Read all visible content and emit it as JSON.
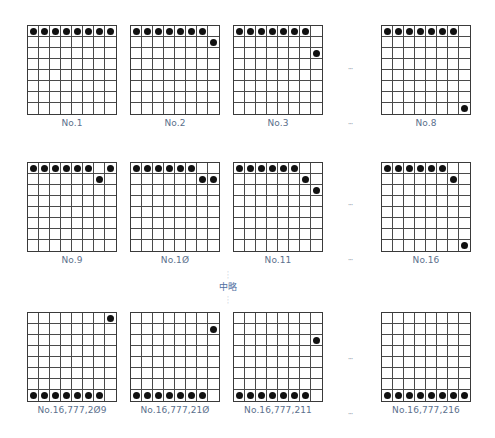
{
  "grid": {
    "rows": 8,
    "cols": 8
  },
  "boards": [
    {
      "label": "No.1",
      "x": 27,
      "y": 25,
      "stones": [
        [
          0,
          0
        ],
        [
          0,
          1
        ],
        [
          0,
          2
        ],
        [
          0,
          3
        ],
        [
          0,
          4
        ],
        [
          0,
          5
        ],
        [
          0,
          6
        ],
        [
          0,
          7
        ]
      ]
    },
    {
      "label": "No.2",
      "x": 130,
      "y": 25,
      "stones": [
        [
          0,
          0
        ],
        [
          0,
          1
        ],
        [
          0,
          2
        ],
        [
          0,
          3
        ],
        [
          0,
          4
        ],
        [
          0,
          5
        ],
        [
          0,
          6
        ],
        [
          1,
          7
        ]
      ]
    },
    {
      "label": "No.3",
      "x": 233,
      "y": 25,
      "stones": [
        [
          0,
          0
        ],
        [
          0,
          1
        ],
        [
          0,
          2
        ],
        [
          0,
          3
        ],
        [
          0,
          4
        ],
        [
          0,
          5
        ],
        [
          0,
          6
        ],
        [
          2,
          7
        ]
      ]
    },
    {
      "label": "No.8",
      "x": 381,
      "y": 25,
      "stones": [
        [
          0,
          0
        ],
        [
          0,
          1
        ],
        [
          0,
          2
        ],
        [
          0,
          3
        ],
        [
          0,
          4
        ],
        [
          0,
          5
        ],
        [
          0,
          6
        ],
        [
          7,
          7
        ]
      ]
    },
    {
      "label": "No.9",
      "x": 27,
      "y": 162,
      "stones": [
        [
          0,
          0
        ],
        [
          0,
          1
        ],
        [
          0,
          2
        ],
        [
          0,
          3
        ],
        [
          0,
          4
        ],
        [
          0,
          5
        ],
        [
          1,
          6
        ],
        [
          0,
          7
        ]
      ]
    },
    {
      "label": "No.1Ø",
      "x": 130,
      "y": 162,
      "stones": [
        [
          0,
          0
        ],
        [
          0,
          1
        ],
        [
          0,
          2
        ],
        [
          0,
          3
        ],
        [
          0,
          4
        ],
        [
          0,
          5
        ],
        [
          1,
          6
        ],
        [
          1,
          7
        ]
      ]
    },
    {
      "label": "No.11",
      "x": 233,
      "y": 162,
      "stones": [
        [
          0,
          0
        ],
        [
          0,
          1
        ],
        [
          0,
          2
        ],
        [
          0,
          3
        ],
        [
          0,
          4
        ],
        [
          0,
          5
        ],
        [
          1,
          6
        ],
        [
          2,
          7
        ]
      ]
    },
    {
      "label": "No.16",
      "x": 381,
      "y": 162,
      "stones": [
        [
          0,
          0
        ],
        [
          0,
          1
        ],
        [
          0,
          2
        ],
        [
          0,
          3
        ],
        [
          0,
          4
        ],
        [
          0,
          5
        ],
        [
          1,
          6
        ],
        [
          7,
          7
        ]
      ]
    },
    {
      "label": "No.16,777,2Ø9",
      "x": 27,
      "y": 312,
      "stones": [
        [
          7,
          0
        ],
        [
          7,
          1
        ],
        [
          7,
          2
        ],
        [
          7,
          3
        ],
        [
          7,
          4
        ],
        [
          7,
          5
        ],
        [
          7,
          6
        ],
        [
          0,
          7
        ]
      ]
    },
    {
      "label": "No.16,777,21Ø",
      "x": 130,
      "y": 312,
      "stones": [
        [
          7,
          0
        ],
        [
          7,
          1
        ],
        [
          7,
          2
        ],
        [
          7,
          3
        ],
        [
          7,
          4
        ],
        [
          7,
          5
        ],
        [
          7,
          6
        ],
        [
          1,
          7
        ]
      ]
    },
    {
      "label": "No.16,777,211",
      "x": 233,
      "y": 312,
      "stones": [
        [
          7,
          0
        ],
        [
          7,
          1
        ],
        [
          7,
          2
        ],
        [
          7,
          3
        ],
        [
          7,
          4
        ],
        [
          7,
          5
        ],
        [
          7,
          6
        ],
        [
          2,
          7
        ]
      ]
    },
    {
      "label": "No.16,777,216",
      "x": 381,
      "y": 312,
      "stones": [
        [
          7,
          0
        ],
        [
          7,
          1
        ],
        [
          7,
          2
        ],
        [
          7,
          3
        ],
        [
          7,
          4
        ],
        [
          7,
          5
        ],
        [
          7,
          6
        ],
        [
          7,
          7
        ]
      ]
    }
  ],
  "ellipses": [
    {
      "text": "···",
      "x": 340,
      "y": 65
    },
    {
      "text": "···",
      "x": 340,
      "y": 120
    },
    {
      "text": "···",
      "x": 340,
      "y": 201
    },
    {
      "text": "···",
      "x": 340,
      "y": 256
    },
    {
      "text": "···",
      "x": 340,
      "y": 355
    },
    {
      "text": "···",
      "x": 340,
      "y": 410
    }
  ],
  "omission": {
    "text": "中略",
    "dots": "·\n·\n·"
  },
  "colors": {
    "label": "#5b6f8c",
    "stone": "#111111",
    "grid": "#3a3a3a",
    "omission": "#4f6f9f"
  }
}
